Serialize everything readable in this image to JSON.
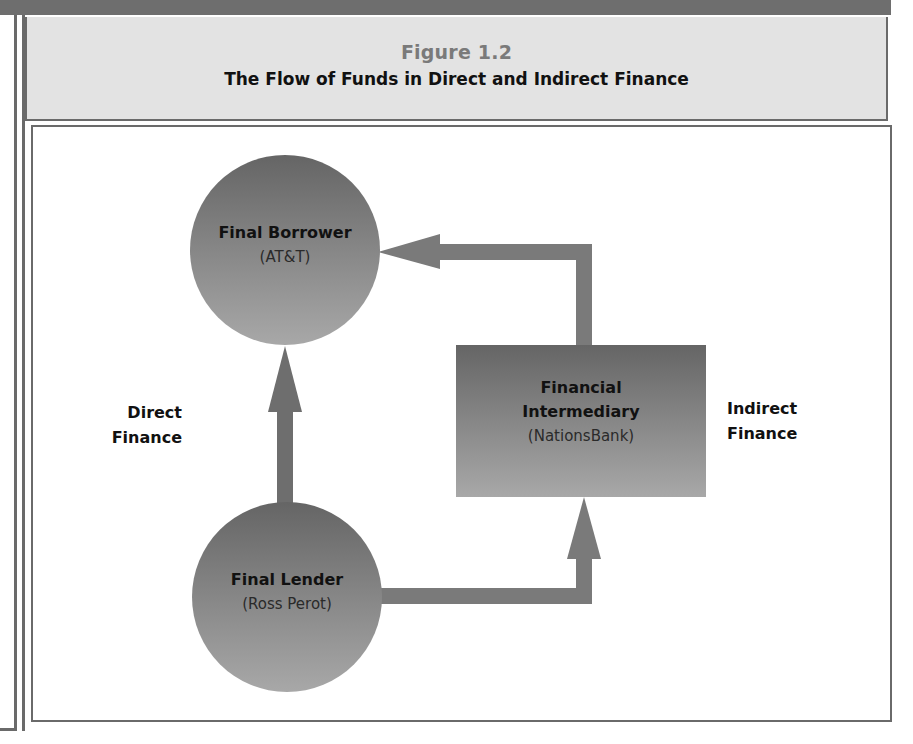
{
  "figure": {
    "number": "Figure 1.2",
    "title": "The Flow of Funds in Direct and Indirect Finance"
  },
  "nodes": {
    "borrower": {
      "title": "Final Borrower",
      "subtitle": "(AT&T)"
    },
    "lender": {
      "title": "Final Lender",
      "subtitle": "(Ross Perot)"
    },
    "intermediary": {
      "title_line1": "Financial",
      "title_line2": "Intermediary",
      "subtitle": "(NationsBank)"
    }
  },
  "labels": {
    "direct_line1": "Direct",
    "direct_line2": "Finance",
    "indirect_line1": "Indirect",
    "indirect_line2": "Finance"
  },
  "colors": {
    "frame": "#6a6a6a",
    "title_bg": "#e3e3e3",
    "shape_dark": "#6c6c6c",
    "shape_light": "#a4a4a4",
    "arrow": "#7a7a7a"
  }
}
